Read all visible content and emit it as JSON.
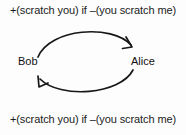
{
  "diagram": {
    "type": "cycle",
    "rules": {
      "top": "+(scratch you) if –(you scratch me)",
      "bottom": "+(scratch you) if –(you scratch me)"
    },
    "nodes": [
      {
        "id": "bob",
        "label": "Bob"
      },
      {
        "id": "alice",
        "label": "Alice"
      }
    ],
    "edges": [
      {
        "id": "bob-to-alice",
        "from": "Bob",
        "to": "Alice",
        "direction": "clockwise-top",
        "arrowhead": "down-right"
      },
      {
        "id": "alice-to-bob",
        "from": "Alice",
        "to": "Bob",
        "direction": "clockwise-bottom",
        "arrowhead": "up-left"
      }
    ],
    "colors": {
      "background": "#fdfdfd",
      "stroke": "#171717",
      "text": "#111111"
    }
  }
}
